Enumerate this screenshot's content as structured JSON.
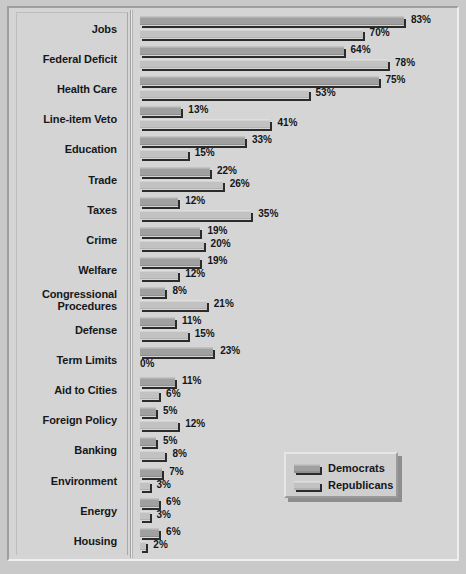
{
  "chart_data": {
    "type": "bar",
    "orientation": "horizontal",
    "title": "",
    "xlabel": "",
    "ylabel": "",
    "xlim": [
      0,
      83
    ],
    "grid": false,
    "legend_position": "bottom-right",
    "value_suffix": "%",
    "categories": [
      "Jobs",
      "Federal Deficit",
      "Health Care",
      "Line-item Veto",
      "Education",
      "Trade",
      "Taxes",
      "Crime",
      "Welfare",
      "Congressional Procedures",
      "Defense",
      "Term Limits",
      "Aid to Cities",
      "Foreign Policy",
      "Banking",
      "Environment",
      "Energy",
      "Housing"
    ],
    "series": [
      {
        "name": "Democrats",
        "values": [
          83,
          64,
          75,
          13,
          33,
          22,
          12,
          19,
          19,
          8,
          11,
          23,
          11,
          5,
          5,
          7,
          6,
          6
        ],
        "labels": [
          "83%",
          "64%",
          "75%",
          "13%",
          "33%",
          "22%",
          "12%",
          "19%",
          "19%",
          "8%",
          "11%",
          "23%",
          "11%",
          "5%",
          "5%",
          "7%",
          "6%",
          "6%"
        ]
      },
      {
        "name": "Republicans",
        "values": [
          70,
          78,
          53,
          41,
          15,
          26,
          35,
          20,
          12,
          21,
          15,
          0,
          6,
          12,
          8,
          3,
          3,
          2
        ],
        "labels": [
          "70%",
          "78%",
          "53%",
          "41%",
          "15%",
          "26%",
          "35%",
          "20%",
          "12%",
          "21%",
          "15%",
          "0%",
          "6%",
          "12%",
          "8%",
          "3%",
          "3%",
          "2%"
        ]
      }
    ]
  },
  "legend": {
    "items": [
      {
        "label": "Democrats",
        "swatch": "dem"
      },
      {
        "label": "Republicans",
        "swatch": "rep"
      }
    ]
  }
}
